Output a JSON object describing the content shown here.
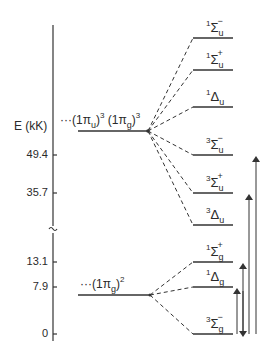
{
  "axis": {
    "label": "E (kK)",
    "ticks": [
      {
        "value": "49.4",
        "y": 155
      },
      {
        "value": "35.7",
        "y": 193
      },
      {
        "value": "13.1",
        "y": 262
      },
      {
        "value": "7.9",
        "y": 287
      },
      {
        "value": "0",
        "y": 334
      }
    ],
    "break_symbol": "≈"
  },
  "configurations": [
    {
      "name": "upper",
      "prefix": "···(1π",
      "sub1": "u",
      "sup1": "3",
      "mid": ")",
      "part2": "(1π",
      "sub2": "g",
      "sup2": "3",
      "end": ")",
      "y": 131
    },
    {
      "name": "lower",
      "prefix": "···(1π",
      "sub1": "g",
      "sup1": "2",
      "end": ")",
      "y": 295
    }
  ],
  "states": [
    {
      "mult": "1",
      "sym": "Σ",
      "sub": "u",
      "sign": "−",
      "y": 38
    },
    {
      "mult": "1",
      "sym": "Σ",
      "sub": "u",
      "sign": "+",
      "y": 70
    },
    {
      "mult": "1",
      "sym": "Δ",
      "sub": "u",
      "sign": "",
      "y": 107
    },
    {
      "mult": "3",
      "sym": "Σ",
      "sub": "u",
      "sign": "−",
      "y": 155
    },
    {
      "mult": "3",
      "sym": "Σ",
      "sub": "u",
      "sign": "+",
      "y": 193
    },
    {
      "mult": "3",
      "sym": "Δ",
      "sub": "u",
      "sign": "",
      "y": 225
    },
    {
      "mult": "1",
      "sym": "Σ",
      "sub": "g",
      "sign": "+",
      "y": 262
    },
    {
      "mult": "1",
      "sym": "Δ",
      "sub": "g",
      "sign": "",
      "y": 287
    },
    {
      "mult": "3",
      "sym": "Σ",
      "sub": "g",
      "sign": "−",
      "y": 334
    }
  ],
  "transitions": [
    {
      "from": "3Σg−",
      "to": "1Δg"
    },
    {
      "from": "3Σg−",
      "to": "1Σg+"
    },
    {
      "from": "3Σg−",
      "to": "3Σu+"
    },
    {
      "from": "3Σg−",
      "to": "3Σu−"
    }
  ]
}
